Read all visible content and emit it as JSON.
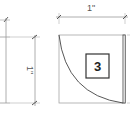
{
  "diagram": {
    "type": "architectural-detail",
    "left_view": {
      "dimension_label": "1\""
    },
    "right_view": {
      "dimension_label": "1\"",
      "tag_label": "3"
    },
    "colors": {
      "line": "#9a9a9a",
      "dark_line": "#333333",
      "background": "#ffffff"
    }
  }
}
